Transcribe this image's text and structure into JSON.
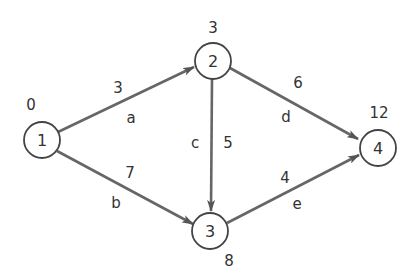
{
  "diagram": {
    "type": "directed-network",
    "colors": {
      "edge": "#666666",
      "node_stroke": "#444444",
      "text": "#333333",
      "background": "#ffffff"
    },
    "nodes": [
      {
        "id": "1",
        "label": "1",
        "value": "0",
        "cx": 42,
        "cy": 140
      },
      {
        "id": "2",
        "label": "2",
        "value": "3",
        "cx": 213,
        "cy": 61
      },
      {
        "id": "3",
        "label": "3",
        "value": "8",
        "cx": 210,
        "cy": 231
      },
      {
        "id": "4",
        "label": "4",
        "value": "12",
        "cx": 378,
        "cy": 148
      }
    ],
    "edges": [
      {
        "name": "a",
        "from": "1",
        "to": "2",
        "weight": "3"
      },
      {
        "name": "b",
        "from": "1",
        "to": "3",
        "weight": "7"
      },
      {
        "name": "c",
        "from": "2",
        "to": "3",
        "weight": "5"
      },
      {
        "name": "d",
        "from": "2",
        "to": "4",
        "weight": "6"
      },
      {
        "name": "e",
        "from": "3",
        "to": "4",
        "weight": "4"
      }
    ]
  }
}
